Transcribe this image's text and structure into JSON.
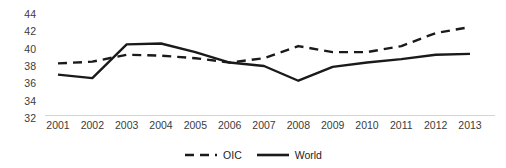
{
  "chart_data": {
    "type": "line",
    "title": "",
    "subtitle": "",
    "xlabel": "",
    "ylabel": "",
    "categories": [
      "2001",
      "2002",
      "2003",
      "2004",
      "2005",
      "2006",
      "2007",
      "2008",
      "2009",
      "2010",
      "2011",
      "2012",
      "2013"
    ],
    "x": [
      2001,
      2002,
      2003,
      2004,
      2005,
      2006,
      2007,
      2008,
      2009,
      2010,
      2011,
      2012,
      2013
    ],
    "series": [
      {
        "name": "OIC",
        "style": "dashed",
        "color": "#1a1a1a",
        "values": [
          38.3,
          38.5,
          39.3,
          39.2,
          38.9,
          38.4,
          38.9,
          40.3,
          39.6,
          39.6,
          40.3,
          41.8,
          42.5
        ]
      },
      {
        "name": "World",
        "style": "solid",
        "color": "#1a1a1a",
        "values": [
          37.0,
          36.6,
          40.5,
          40.6,
          39.6,
          38.4,
          38.0,
          36.3,
          37.9,
          38.4,
          38.8,
          39.3,
          39.4
        ]
      }
    ],
    "ylim": [
      32,
      44
    ],
    "yticks": [
      44,
      42,
      40,
      38,
      36,
      34,
      32
    ],
    "ytick_labels": [
      "44",
      "42",
      "40",
      "38",
      "36",
      "34",
      "32"
    ],
    "xlim": [
      2001,
      2013
    ],
    "grid": false,
    "axis_line_color": "#d4d4d4",
    "tick_label_color": "#3b3b3b",
    "legend": {
      "position": "bottom",
      "entries": [
        {
          "label": "OIC",
          "style": "dashed"
        },
        {
          "label": "World",
          "style": "solid"
        }
      ]
    },
    "annotations": []
  }
}
